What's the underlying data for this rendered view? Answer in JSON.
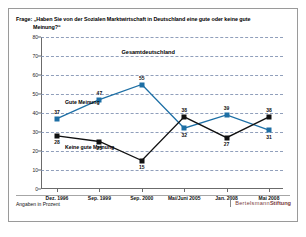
{
  "header": {
    "question_label": "Frage:",
    "question_text": "„Haben Sie von der Sozialen Marktwirtschaft in Deutschland eine gute oder",
    "question_text_line2": "Meinung?“",
    "question_text_tail": "keine gute"
  },
  "footer": {
    "note": "Angaben in Prozent",
    "brand_part1": "Bertelsmann",
    "brand_part2": "Stiftung"
  },
  "annotations": {
    "region_label": "Gesamtdeutschland",
    "series1_label": "Gute Meinung",
    "series2_label": "Keine gute Meinung"
  },
  "colors": {
    "series1": "#1d6fa5",
    "series2": "#111111",
    "grid": "#7d8fb0",
    "axis": "#6b6b6b",
    "brand": "#7a3a3a"
  },
  "chart_data": {
    "type": "line",
    "title": "Gesamtdeutschland",
    "xlabel": "",
    "ylabel": "",
    "ylim": [
      0,
      80
    ],
    "yticks": [
      0,
      10,
      20,
      30,
      40,
      50,
      60,
      70,
      80
    ],
    "grid": true,
    "legend_position": "inline-annotation",
    "categories": [
      "Dez. 1996",
      "Sep. 1999",
      "Sep. 2000",
      "Mai/Juni 2005",
      "Jan. 2008",
      "Mai 2008"
    ],
    "series": [
      {
        "name": "Gute Meinung",
        "color": "#1d6fa5",
        "values": [
          37,
          47,
          55,
          32,
          39,
          31
        ]
      },
      {
        "name": "Keine gute Meinung",
        "color": "#111111",
        "values": [
          28,
          25,
          15,
          38,
          27,
          38
        ]
      }
    ]
  }
}
